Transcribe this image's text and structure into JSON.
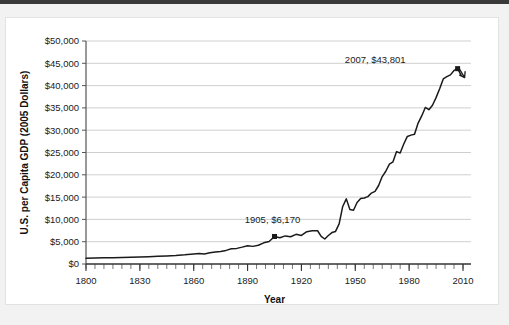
{
  "figure": {
    "background_color": "#ffffff",
    "page_color": "#f2f2f2",
    "top_band_color": "#3a3a3a",
    "border_color": "#e2e2e2"
  },
  "chart_data": {
    "type": "line",
    "title": "",
    "xlabel": "Year",
    "ylabel": "U.S. per Capita GDP (2005 Dollars)",
    "xlim": [
      1800,
      2010
    ],
    "ylim": [
      0,
      50000
    ],
    "grid": true,
    "legend": "none",
    "line_color": "#1a1a1a",
    "x_ticks": [
      1800,
      1830,
      1860,
      1890,
      1920,
      1950,
      1980,
      2010
    ],
    "x_tick_labels": [
      "1800",
      "1830",
      "1860",
      "1890",
      "1920",
      "1950",
      "1980",
      "2010"
    ],
    "x_minor_tick_step": 5,
    "y_ticks": [
      0,
      5000,
      10000,
      15000,
      20000,
      25000,
      30000,
      35000,
      40000,
      45000,
      50000
    ],
    "y_tick_labels": [
      "$0",
      "$5,000",
      "$10,000",
      "$15,000",
      "$20,000",
      "$25,000",
      "$30,000",
      "$35,000",
      "$40,000",
      "$45,000",
      "$50,000"
    ],
    "annotations": [
      {
        "label": "1905, $6,170",
        "x": 1905,
        "y": 6170,
        "marker": "square",
        "label_offset_x": -2,
        "label_offset_y": -13
      },
      {
        "label": "2007, $43,801",
        "x": 2007,
        "y": 43801,
        "marker": "square",
        "label_offset_x": -52,
        "label_offset_y": -6
      }
    ],
    "x": [
      1800,
      1805,
      1810,
      1815,
      1820,
      1825,
      1830,
      1835,
      1840,
      1845,
      1850,
      1855,
      1860,
      1863,
      1866,
      1869,
      1872,
      1875,
      1878,
      1881,
      1884,
      1887,
      1890,
      1893,
      1896,
      1899,
      1902,
      1905,
      1908,
      1911,
      1914,
      1917,
      1920,
      1923,
      1926,
      1929,
      1931,
      1933,
      1935,
      1937,
      1939,
      1941,
      1943,
      1945,
      1947,
      1949,
      1951,
      1953,
      1955,
      1957,
      1959,
      1961,
      1963,
      1965,
      1967,
      1969,
      1971,
      1973,
      1975,
      1977,
      1979,
      1981,
      1983,
      1985,
      1987,
      1989,
      1991,
      1993,
      1995,
      1997,
      1999,
      2001,
      2003,
      2005,
      2007,
      2009
    ],
    "y": [
      1300,
      1330,
      1380,
      1420,
      1450,
      1500,
      1560,
      1640,
      1720,
      1800,
      1900,
      2050,
      2250,
      2380,
      2260,
      2500,
      2700,
      2820,
      3050,
      3400,
      3500,
      3780,
      4100,
      3950,
      4200,
      4750,
      5050,
      6170,
      5900,
      6300,
      6100,
      6650,
      6400,
      7250,
      7450,
      7450,
      6200,
      5600,
      6400,
      7050,
      7300,
      9000,
      12900,
      14600,
      12200,
      12050,
      13800,
      14700,
      14800,
      15100,
      15900,
      16300,
      17600,
      19600,
      20800,
      22400,
      22900,
      25200,
      24900,
      26900,
      28600,
      28900,
      29100,
      31600,
      33200,
      35100,
      34600,
      35600,
      37300,
      39300,
      41500,
      42000,
      42400,
      43400,
      43801,
      42300
    ]
  }
}
